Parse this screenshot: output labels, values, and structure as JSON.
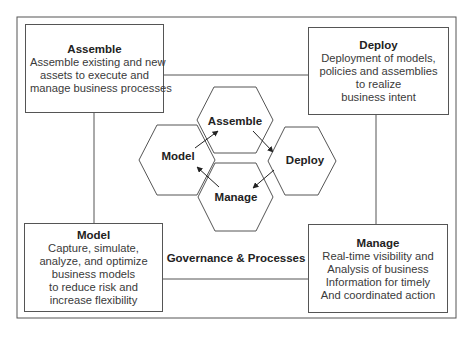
{
  "diagram": {
    "center_label": "Governance & Processes",
    "boxes": {
      "assemble": {
        "title": "Assemble",
        "lines": [
          "Assemble existing and new",
          "assets to execute and",
          "manage business processes"
        ]
      },
      "deploy": {
        "title": "Deploy",
        "lines": [
          "Deployment of models,",
          "policies and assemblies",
          "to realize",
          "business intent"
        ]
      },
      "model": {
        "title": "Model",
        "lines": [
          "Capture, simulate,",
          "analyze, and optimize",
          "business models",
          "to reduce risk and",
          "increase flexibility"
        ]
      },
      "manage": {
        "title": "Manage",
        "lines": [
          "Real-time visibility and",
          "Analysis of business",
          "Information for timely",
          "And coordinated action"
        ]
      }
    },
    "hexagons": {
      "assemble": "Assemble",
      "model": "Model",
      "deploy": "Deploy",
      "manage": "Manage"
    },
    "cycle": [
      "Model",
      "Assemble",
      "Deploy",
      "Manage",
      "Model"
    ],
    "colors": {
      "stroke": "#555555",
      "text": "#222222",
      "background": "#ffffff"
    }
  }
}
